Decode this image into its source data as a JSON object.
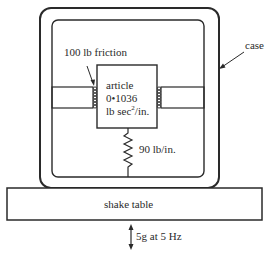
{
  "diagram": {
    "type": "mechanical-schematic",
    "labels": {
      "friction": "100 lb friction",
      "case": "case",
      "article_line1": "article",
      "article_line2": "0•1036",
      "article_line3_a": "lb sec",
      "article_line3_sup": "2",
      "article_line3_b": "/in.",
      "spring": "90 lb/in.",
      "table": "shake table",
      "excitation": "5g at 5 Hz"
    },
    "components": [
      {
        "id": "case",
        "kind": "rounded-enclosure"
      },
      {
        "id": "article",
        "kind": "mass",
        "value": "0.1036 lb sec^2/in."
      },
      {
        "id": "spring",
        "kind": "spring",
        "value": "90 lb/in."
      },
      {
        "id": "friction-left",
        "kind": "coulomb-friction-pad",
        "value": "100 lb"
      },
      {
        "id": "friction-right",
        "kind": "coulomb-friction-pad"
      },
      {
        "id": "shake-table",
        "kind": "base"
      },
      {
        "id": "excitation-arrow",
        "kind": "double-arrow",
        "value": "5g at 5 Hz"
      }
    ],
    "colors": {
      "line": "#2a2a2a",
      "background": "#ffffff"
    }
  }
}
